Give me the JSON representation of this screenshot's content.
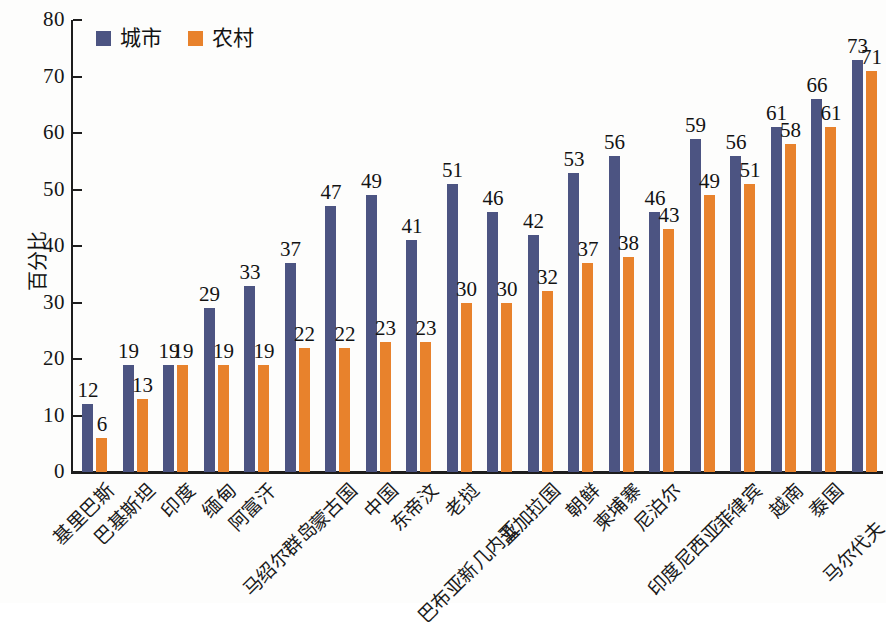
{
  "chart_data": {
    "type": "bar",
    "title": "",
    "xlabel": "",
    "ylabel": "百分比",
    "ylim": [
      0,
      80
    ],
    "ytick_values": [
      80,
      70,
      60,
      50,
      40,
      30,
      20,
      10,
      0
    ],
    "ytick_labels": [
      "80",
      "70",
      "60",
      "50",
      "40",
      "30",
      "20",
      "10",
      "0"
    ],
    "grid": false,
    "legend_position": "top-left",
    "categories": [
      "基里巴斯",
      "巴基斯坦",
      "印度",
      "缅甸",
      "阿富汗",
      "马绍尔群岛",
      "蒙古国",
      "中国",
      "东帝汶",
      "老挝",
      "巴布亚新几内亚",
      "孟加拉国",
      "朝鲜",
      "柬埔寨",
      "尼泊尔",
      "印度尼西亚",
      "菲律宾",
      "越南",
      "泰国",
      "马尔代夫"
    ],
    "series": [
      {
        "name": "城市",
        "color": "#4c5482",
        "values": [
          12,
          19,
          19,
          29,
          33,
          37,
          47,
          49,
          41,
          51,
          46,
          42,
          53,
          56,
          46,
          59,
          56,
          61,
          66,
          73
        ]
      },
      {
        "name": "农村",
        "color": "#e8822c",
        "values": [
          6,
          13,
          19,
          19,
          19,
          22,
          22,
          23,
          23,
          30,
          30,
          32,
          37,
          38,
          43,
          49,
          51,
          58,
          61,
          71
        ]
      }
    ]
  },
  "legend": {
    "entries": [
      {
        "label": "城市",
        "color": "#4c5482"
      },
      {
        "label": "农村",
        "color": "#e8822c"
      }
    ]
  }
}
